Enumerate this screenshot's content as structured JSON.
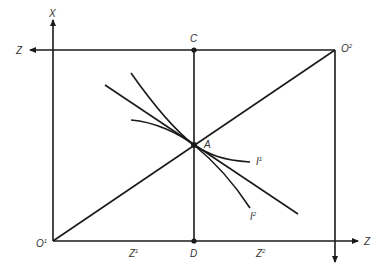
{
  "diagram": {
    "type": "edgeworth-box",
    "labels": {
      "x_axis": "X",
      "z_left": "Z",
      "z_right": "Z",
      "origin1": "O",
      "origin1_sup": "1",
      "origin2": "O",
      "origin2_sup": "2",
      "point_c": "C",
      "point_d": "D",
      "point_a": "A",
      "z1": "Z",
      "z1_sup": "1",
      "z2": "Z",
      "z2_sup": "2",
      "i1": "I",
      "i1_sup": "1",
      "i2": "I",
      "i2_sup": "2"
    },
    "points": {
      "O1": [
        53,
        241
      ],
      "O2": [
        335,
        50
      ],
      "A": [
        194,
        145
      ],
      "C": [
        194,
        50
      ],
      "D": [
        194,
        241
      ]
    },
    "colors": {
      "line": "#1a1a1a",
      "text": "#333333",
      "background": "#ffffff"
    }
  }
}
